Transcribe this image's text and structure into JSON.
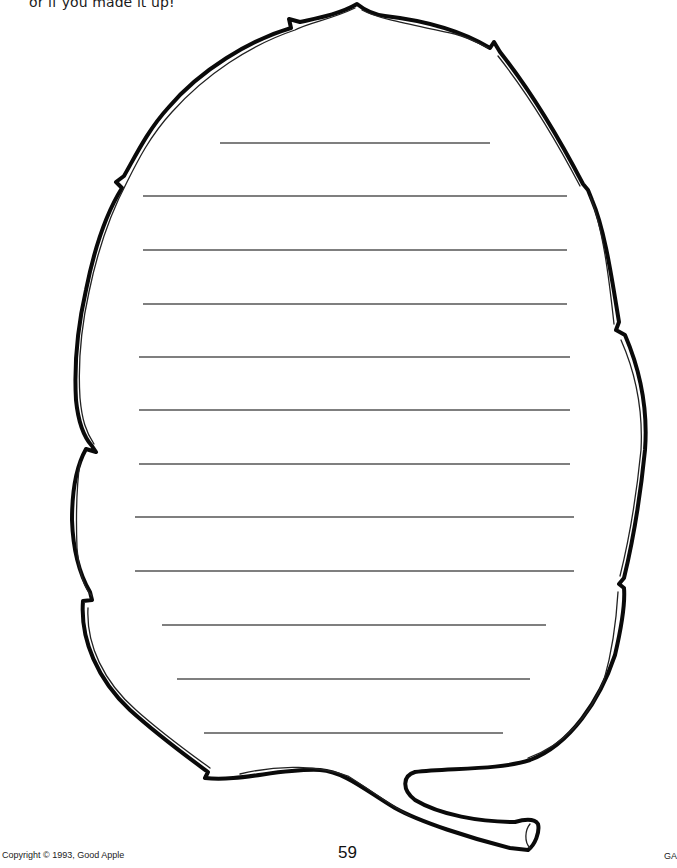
{
  "worksheet": {
    "instruction_text": "or if you made it up!",
    "shape": "leaf-outline",
    "writing_lines": [
      {
        "y": 143,
        "x1": 220,
        "x2": 490
      },
      {
        "y": 196,
        "x1": 143,
        "x2": 567
      },
      {
        "y": 250,
        "x1": 143,
        "x2": 567
      },
      {
        "y": 304,
        "x1": 143,
        "x2": 567
      },
      {
        "y": 357,
        "x1": 139,
        "x2": 570
      },
      {
        "y": 410,
        "x1": 139,
        "x2": 570
      },
      {
        "y": 464,
        "x1": 139,
        "x2": 570
      },
      {
        "y": 517,
        "x1": 135,
        "x2": 574
      },
      {
        "y": 571,
        "x1": 135,
        "x2": 574
      },
      {
        "y": 625,
        "x1": 162,
        "x2": 546
      },
      {
        "y": 679,
        "x1": 177,
        "x2": 530
      },
      {
        "y": 733,
        "x1": 204,
        "x2": 503
      }
    ],
    "colors": {
      "outline": "#0a0a0a",
      "lines": "#555555",
      "background": "#ffffff"
    }
  },
  "footer": {
    "copyright": "Copyright © 1993, Good Apple",
    "page_number": "59",
    "code": "GA"
  }
}
